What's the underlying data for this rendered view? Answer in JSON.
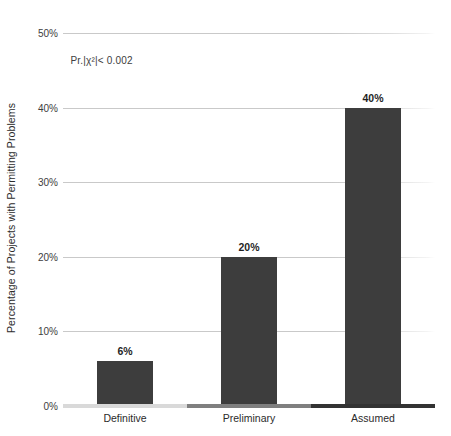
{
  "chart_data": {
    "type": "bar",
    "title": "",
    "subtitle": "",
    "categories": [
      "Definitive",
      "Preliminary",
      "Assumed"
    ],
    "values": [
      6,
      20,
      40
    ],
    "value_labels": [
      "6%",
      "20%",
      "40%"
    ],
    "xlabel": "",
    "ylabel": "Percentage of  Projects with Permitting Problems",
    "ylim": [
      0,
      50
    ],
    "ytick_labels": [
      "0%",
      "10%",
      "20%",
      "30%",
      "40%",
      "50%"
    ],
    "ytick_values": [
      0,
      10,
      20,
      30,
      40,
      50
    ],
    "grid": true,
    "legend": "none",
    "annotations": [
      {
        "text": "Pr.|χ²|< 0.002",
        "x_pct": 2,
        "y_value": 47
      }
    ],
    "series": [
      {
        "name": "Percentage of Projects with Permitting Problems",
        "values": [
          6,
          20,
          40
        ]
      }
    ],
    "colors": {
      "bar": "#3d3d3d",
      "gridline": "#c9c9c9",
      "text": "#2b2b2b",
      "axis_segment_1": "#d9d9d9",
      "axis_segment_2": "#7f7f7f",
      "axis_segment_3": "#333333"
    },
    "axis_segments": [
      "#d9d9d9",
      "#7f7f7f",
      "#333333"
    ]
  }
}
